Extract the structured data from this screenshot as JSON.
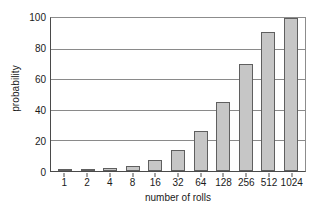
{
  "chart_data": {
    "type": "bar",
    "title": "",
    "subtitle": "",
    "xlabel": "number of rolls",
    "ylabel": "probability",
    "categories": [
      "1",
      "2",
      "4",
      "8",
      "16",
      "32",
      "64",
      "128",
      "256",
      "512",
      "1024"
    ],
    "values": [
      0.3,
      1,
      2,
      3.5,
      7,
      14,
      26,
      45,
      70,
      91,
      100
    ],
    "series": [
      {
        "name": "probability",
        "values": [
          0.3,
          1,
          2,
          3.5,
          7,
          14,
          26,
          45,
          70,
          91,
          100
        ]
      }
    ],
    "ylim": [
      0,
      100
    ],
    "yticks": [
      0,
      20,
      40,
      60,
      80,
      100
    ],
    "ytick_labels": [
      "0",
      "20",
      "40",
      "60",
      "80",
      "100"
    ],
    "xtick_labels": [
      "1",
      "2",
      "4",
      "8",
      "16",
      "32",
      "64",
      "128",
      "256",
      "512",
      "1024"
    ],
    "grid": "horizontal",
    "legend": "none",
    "annotations": [],
    "colors": {
      "bar_fill": "#c6c6c6",
      "bar_edge": "#5f5f5f",
      "gridline": "#8a8a8a",
      "axis": "#4a4a4a",
      "text": "#1a1a1a",
      "background": "#ffffff"
    }
  }
}
